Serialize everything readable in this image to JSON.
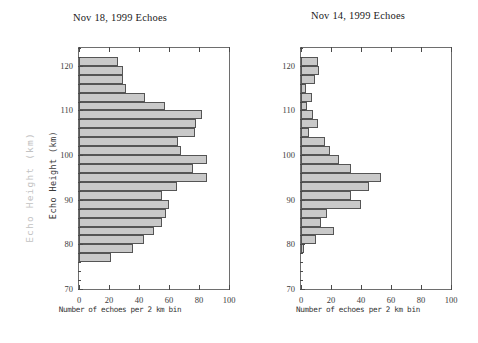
{
  "figure": {
    "ghost_ylabel": "Echo  Height  (km)",
    "main_ylabel": "Echo Height (km)"
  },
  "chart_data": [
    {
      "type": "bar",
      "orientation": "horizontal",
      "title": "Nov 18, 1999  Echoes",
      "xlabel": "Number of echoes per 2 km bin",
      "ylabel": "Echo Height (km)",
      "xlim": [
        0,
        100
      ],
      "ylim": [
        70,
        124
      ],
      "xticks": [
        0,
        20,
        40,
        60,
        80,
        100
      ],
      "yticks": [
        70,
        80,
        90,
        100,
        110,
        120
      ],
      "grid": false,
      "legend": null,
      "bin_width": 2,
      "categories": [
        121,
        119,
        117,
        115,
        113,
        111,
        109,
        107,
        105,
        103,
        101,
        99,
        97,
        95,
        93,
        91,
        89,
        87,
        85,
        83,
        81,
        79,
        77
      ],
      "values": [
        26,
        29,
        29,
        31,
        44,
        57,
        82,
        78,
        77,
        66,
        68,
        85,
        76,
        85,
        65,
        55,
        60,
        58,
        55,
        50,
        43,
        36,
        21
      ]
    },
    {
      "type": "bar",
      "orientation": "horizontal",
      "title": "Nov 14, 1999  Echoes",
      "xlabel": "Number of echoes per 2 km bin",
      "ylabel": "Echo Height (km)",
      "xlim": [
        0,
        100
      ],
      "ylim": [
        70,
        124
      ],
      "xticks": [
        0,
        20,
        40,
        60,
        80,
        100
      ],
      "yticks": [
        70,
        80,
        90,
        100,
        110,
        120
      ],
      "grid": false,
      "legend": null,
      "bin_width": 2,
      "categories": [
        121,
        119,
        117,
        115,
        113,
        111,
        109,
        107,
        105,
        103,
        101,
        99,
        97,
        95,
        93,
        91,
        89,
        87,
        85,
        83,
        81,
        79,
        77
      ],
      "values": [
        11,
        12,
        9,
        3,
        7,
        4,
        8,
        11,
        5,
        16,
        19,
        25,
        33,
        53,
        45,
        33,
        40,
        17,
        13,
        22,
        10,
        2,
        0
      ]
    }
  ]
}
